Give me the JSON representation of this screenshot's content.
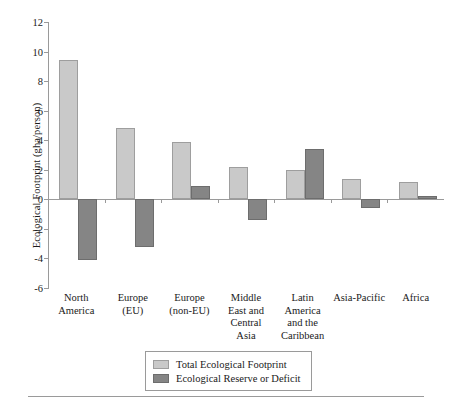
{
  "chart_data": {
    "type": "bar",
    "title": "",
    "xlabel": "",
    "ylabel": "Ecological Footprint (gha/person)",
    "ylim": [
      -6,
      12
    ],
    "ytick_labels": [
      "12",
      "10",
      "8",
      "6",
      "4",
      "2",
      "0",
      "-2",
      "-4",
      "-6"
    ],
    "yticks": [
      12,
      10,
      8,
      6,
      4,
      2,
      0,
      -2,
      -4,
      -6
    ],
    "grid": false,
    "legend_position": "bottom-center",
    "categories": [
      "North America",
      "Europe (EU)",
      "Europe (non-EU)",
      "Middle East and Central Asia",
      "Latin America and the Caribbean",
      "Asia-Pacific",
      "Africa"
    ],
    "category_lines": [
      [
        "North",
        "America"
      ],
      [
        "Europe",
        "(EU)"
      ],
      [
        "Europe",
        "(non-EU)"
      ],
      [
        "Middle",
        "East and",
        "Central",
        "Asia"
      ],
      [
        "Latin",
        "America",
        "and the",
        "Caribbean"
      ],
      [
        "Asia-Pacific"
      ],
      [
        "Africa"
      ]
    ],
    "series": [
      {
        "name": "Total Ecological Footprint",
        "color": "#c9c9c9",
        "values": [
          9.4,
          4.8,
          3.85,
          2.2,
          2.0,
          1.4,
          1.2
        ]
      },
      {
        "name": "Ecological Reserve or Deficit",
        "color": "#858585",
        "values": [
          -4.1,
          -3.2,
          0.9,
          -1.4,
          3.4,
          -0.6,
          0.25
        ]
      }
    ]
  },
  "legend": {
    "items": [
      {
        "label": "Total Ecological Footprint"
      },
      {
        "label": "Ecological Reserve or Deficit"
      }
    ]
  }
}
